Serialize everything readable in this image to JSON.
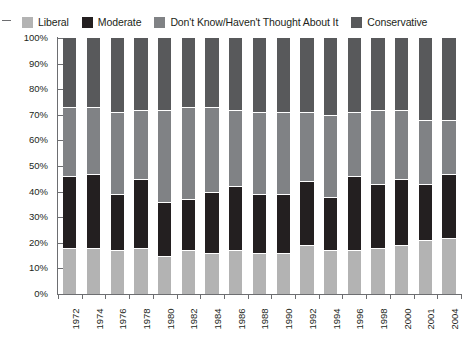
{
  "chart_data": {
    "type": "bar",
    "stacked": true,
    "normalized_percent": true,
    "title": "",
    "subtitle": "",
    "xlabel": "",
    "ylabel": "",
    "ylim": [
      0,
      100
    ],
    "ytick_labels": [
      "100%",
      "90%",
      "80%",
      "70%",
      "60%",
      "50%",
      "40%",
      "30%",
      "20%",
      "10%",
      "0%"
    ],
    "ytick_values": [
      100,
      90,
      80,
      70,
      60,
      50,
      40,
      30,
      20,
      10,
      0
    ],
    "grid": false,
    "legend_position": "top",
    "categories": [
      "1972",
      "1974",
      "1976",
      "1978",
      "1980",
      "1982",
      "1984",
      "1986",
      "1988",
      "1990",
      "1992",
      "1994",
      "1996",
      "1998",
      "2000",
      "2001",
      "2004"
    ],
    "stack_order_bottom_to_top": [
      "Liberal",
      "Moderate",
      "Don't Know/Haven't Thought About It",
      "Conservative"
    ],
    "series": [
      {
        "name": "Liberal",
        "color": "#b3b3b3",
        "values": [
          18,
          18,
          17,
          18,
          15,
          17,
          16,
          17,
          16,
          16,
          19,
          17,
          17,
          18,
          19,
          21,
          22
        ]
      },
      {
        "name": "Moderate",
        "color": "#231f20",
        "values": [
          28,
          29,
          22,
          27,
          21,
          20,
          24,
          25,
          23,
          23,
          25,
          21,
          29,
          25,
          26,
          22,
          25
        ]
      },
      {
        "name": "Don't Know/Haven't Thought About It",
        "color": "#808285",
        "values": [
          27,
          26,
          32,
          27,
          36,
          36,
          33,
          30,
          32,
          32,
          27,
          32,
          25,
          29,
          27,
          25,
          21
        ]
      },
      {
        "name": "Conservative",
        "color": "#58595b",
        "values": [
          27,
          27,
          29,
          28,
          28,
          27,
          27,
          28,
          29,
          29,
          29,
          30,
          29,
          28,
          28,
          32,
          32
        ]
      }
    ],
    "boundaries_cumulative_percent": {
      "liberal_top": [
        18,
        18,
        17,
        18,
        15,
        17,
        16,
        17,
        16,
        16,
        19,
        17,
        17,
        18,
        19,
        21,
        22
      ],
      "moderate_top": [
        46,
        47,
        39,
        45,
        36,
        37,
        40,
        42,
        39,
        39,
        44,
        38,
        46,
        43,
        45,
        43,
        47
      ],
      "dontknow_top": [
        73,
        73,
        71,
        72,
        72,
        73,
        73,
        72,
        71,
        71,
        71,
        70,
        71,
        72,
        72,
        68,
        68
      ]
    }
  },
  "legend": {
    "items": [
      {
        "label": "Liberal",
        "color": "#b3b3b3"
      },
      {
        "label": "Moderate",
        "color": "#231f20"
      },
      {
        "label": "Don't Know/Haven't Thought About It",
        "color": "#808285"
      },
      {
        "label": "Conservative",
        "color": "#58595b"
      }
    ]
  }
}
